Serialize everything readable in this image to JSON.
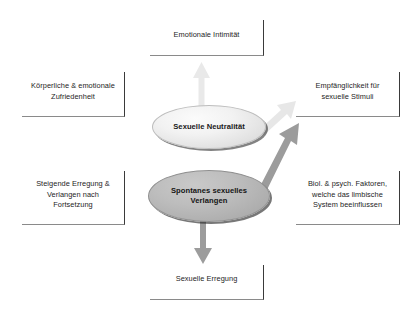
{
  "diagram": {
    "language": "de",
    "background_color": "#ffffff"
  },
  "boxes": [
    {
      "id": "emotionale-intimitaet",
      "label": "Emotionale Intimität",
      "position": "top",
      "text_color": "#1d1d1d"
    },
    {
      "id": "koerperliche-zufriedenheit",
      "label": "Körperliche & emotionale\nZufriedenheit",
      "position": "left-top",
      "text_color": "#1d1d1d"
    },
    {
      "id": "empfaenglichkeit",
      "label": "Empfänglichkeit für\nsexuelle Stimuli",
      "position": "right-top",
      "text_color": "#1d1d1d"
    },
    {
      "id": "steigende-erregung",
      "label": "Steigende Erregung &\nVerlangen nach\nFortsetzung",
      "position": "left-bottom",
      "text_color": "#1d1d1d"
    },
    {
      "id": "biol-psych-faktoren",
      "label": "Biol. & psych. Faktoren,\nwelche das limbische\nSystem beeinflussen",
      "position": "right-bottom",
      "text_color": "#1d1d1d"
    },
    {
      "id": "sexuelle-erregung",
      "label": "Sexuelle Erregung",
      "position": "bottom",
      "text_color": "#1d1d1d"
    }
  ],
  "nodes": [
    {
      "id": "sexuelle-neutralitaet",
      "label": "Sexuelle Neutralität",
      "shape": "ellipse",
      "fill": "#eeeeee",
      "stroke": "#bdbdbd"
    },
    {
      "id": "spontanes-sexuelles-verlangen",
      "label": "Spontanes sexuelles\nVerlangen",
      "shape": "ellipse",
      "fill": "#b4b4b4",
      "stroke": "#8f8f8f"
    }
  ],
  "arrows": [
    {
      "id": "neutralitaet-to-emotionale-intimitaet",
      "from": "sexuelle-neutralitaet",
      "to": "emotionale-intimitaet",
      "direction": "up",
      "color": "#e8e8e8"
    },
    {
      "id": "neutralitaet-to-empfaenglichkeit",
      "from": "sexuelle-neutralitaet",
      "to": "empfaenglichkeit",
      "direction": "up-right",
      "color": "#e6e6e6"
    },
    {
      "id": "verlangen-to-empfaenglichkeit",
      "from": "spontanes-sexuelles-verlangen",
      "to": "empfaenglichkeit",
      "direction": "up-right",
      "color": "#9a9a9a"
    },
    {
      "id": "verlangen-to-sexuelle-erregung",
      "from": "spontanes-sexuelles-verlangen",
      "to": "sexuelle-erregung",
      "direction": "down",
      "color": "#9a9a9a"
    }
  ]
}
